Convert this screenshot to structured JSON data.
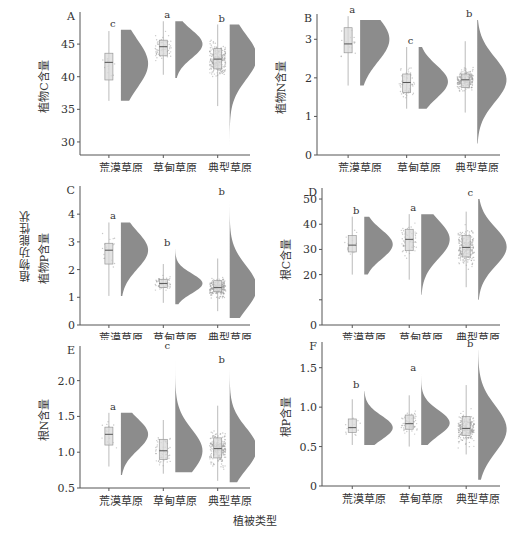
{
  "figure": {
    "group_ylabel": "植物功能性状",
    "xlabel": "植被类型",
    "caption": "图  不同植被类型植物与根系碳氮磷含量"
  },
  "style": {
    "density_color": "#8c8c8c",
    "box_fill": "#d9d9d9",
    "point_color": "#9a9a9a",
    "axis_color": "#555555"
  },
  "chart_data": [
    {
      "id": "A",
      "type": "raincloud",
      "panel_label": "A",
      "ylabel": "植物C含量",
      "categories": [
        "荒漠草原",
        "草甸草原",
        "典型草原"
      ],
      "ylim": [
        28,
        49
      ],
      "yticks": [
        30,
        35,
        40,
        45
      ],
      "letters": [
        "c",
        "a",
        "b"
      ],
      "box": [
        {
          "min": 36.3,
          "q1": 39.5,
          "median": 42.2,
          "q3": 43.6,
          "max": 47.0
        },
        {
          "min": 40.3,
          "q1": 43.2,
          "median": 44.6,
          "q3": 45.6,
          "max": 48.5
        },
        {
          "min": 35.5,
          "q1": 41.2,
          "median": 42.7,
          "q3": 44.3,
          "max": 48.0
        }
      ],
      "density_range": [
        [
          36.3,
          47.2
        ],
        [
          39.8,
          48.5
        ],
        [
          29.0,
          48.0
        ]
      ],
      "density_peak": [
        42.0,
        45.0,
        43.0
      ],
      "n_points": [
        15,
        60,
        300
      ],
      "grid": false
    },
    {
      "id": "B",
      "type": "raincloud",
      "panel_label": "B",
      "ylabel": "植物N含量",
      "categories": [
        "荒漠草原",
        "草甸草原",
        "典型草原"
      ],
      "ylim": [
        0,
        3.5
      ],
      "yticks": [
        0,
        1,
        2,
        3
      ],
      "letters": [
        "a",
        "c",
        "b"
      ],
      "box": [
        {
          "min": 1.8,
          "q1": 2.65,
          "median": 2.88,
          "q3": 3.3,
          "max": 3.6
        },
        {
          "min": 1.2,
          "q1": 1.62,
          "median": 1.88,
          "q3": 2.1,
          "max": 2.8
        },
        {
          "min": 1.1,
          "q1": 1.75,
          "median": 1.95,
          "q3": 2.1,
          "max": 2.95
        }
      ],
      "density_range": [
        [
          1.8,
          3.5
        ],
        [
          1.2,
          2.8
        ],
        [
          0.3,
          3.5
        ]
      ],
      "density_peak": [
        3.0,
        1.9,
        1.95
      ],
      "n_points": [
        15,
        60,
        300
      ],
      "grid": false
    },
    {
      "id": "C",
      "type": "raincloud",
      "panel_label": "C",
      "ylabel": "植物P含量",
      "categories": [
        "荒漠草原",
        "草甸草原",
        "典型草原"
      ],
      "ylim": [
        0,
        4.8
      ],
      "yticks": [
        0,
        1,
        2,
        3,
        4
      ],
      "letters": [
        "a",
        "b",
        "b"
      ],
      "box": [
        {
          "min": 1.05,
          "q1": 2.2,
          "median": 2.7,
          "q3": 2.95,
          "max": 3.7
        },
        {
          "min": 0.8,
          "q1": 1.35,
          "median": 1.5,
          "q3": 1.65,
          "max": 2.2
        },
        {
          "min": 0.5,
          "q1": 1.2,
          "median": 1.35,
          "q3": 1.6,
          "max": 2.4
        }
      ],
      "density_range": [
        [
          1.05,
          3.7
        ],
        [
          0.75,
          2.75
        ],
        [
          0.25,
          4.6
        ]
      ],
      "density_peak": [
        2.7,
        1.5,
        1.35
      ],
      "n_points": [
        15,
        60,
        300
      ],
      "grid": false
    },
    {
      "id": "D",
      "type": "raincloud",
      "panel_label": "D",
      "ylabel": "根C含量",
      "categories": [
        "荒漠草原",
        "草甸草原",
        "典型草原"
      ],
      "ylim": [
        0,
        52
      ],
      "yticks": [
        0,
        10,
        20,
        30,
        40,
        50
      ],
      "ytick_labels": [
        "0",
        "",
        "20",
        "30",
        "40",
        "50"
      ],
      "letters": [
        "b",
        "a",
        "c"
      ],
      "box": [
        {
          "min": 20,
          "q1": 29,
          "median": 31.7,
          "q3": 35.5,
          "max": 43
        },
        {
          "min": 18,
          "q1": 29.5,
          "median": 34,
          "q3": 38,
          "max": 44
        },
        {
          "min": 15,
          "q1": 27,
          "median": 30.8,
          "q3": 35.5,
          "max": 45
        }
      ],
      "density_range": [
        [
          20,
          43
        ],
        [
          12,
          44
        ],
        [
          10,
          50
        ]
      ],
      "density_peak": [
        32,
        34,
        31
      ],
      "n_points": [
        15,
        60,
        300
      ],
      "grid": false
    },
    {
      "id": "E",
      "type": "raincloud",
      "panel_label": "E",
      "ylabel": "根N含量",
      "categories": [
        "荒漠草原",
        "草甸草原",
        "典型草原"
      ],
      "ylim": [
        0.5,
        2.4
      ],
      "yticks": [
        0.5,
        1.0,
        1.5,
        2.0
      ],
      "ytick_labels": [
        "0.5",
        "1.0",
        "1.5",
        "2.0"
      ],
      "letters": [
        "a",
        "c",
        "b"
      ],
      "box": [
        {
          "min": 0.8,
          "q1": 1.1,
          "median": 1.25,
          "q3": 1.35,
          "max": 1.55
        },
        {
          "min": 0.7,
          "q1": 0.9,
          "median": 1.02,
          "q3": 1.18,
          "max": 1.45
        },
        {
          "min": 0.6,
          "q1": 0.92,
          "median": 1.05,
          "q3": 1.2,
          "max": 1.65
        }
      ],
      "density_range": [
        [
          0.68,
          1.55
        ],
        [
          0.72,
          2.4
        ],
        [
          0.58,
          2.2
        ]
      ],
      "density_peak": [
        1.25,
        1.02,
        1.05
      ],
      "n_points": [
        15,
        60,
        300
      ],
      "grid": false
    },
    {
      "id": "F",
      "type": "raincloud",
      "panel_label": "F",
      "ylabel": "根P含量",
      "categories": [
        "荒漠草原",
        "草甸草原",
        "典型草原"
      ],
      "ylim": [
        0,
        1.75
      ],
      "yticks": [
        0,
        0.5,
        1.0,
        1.5
      ],
      "ytick_labels": [
        "0",
        "0.5",
        "1.0",
        "1.5"
      ],
      "letters": [
        "b",
        "a",
        "b"
      ],
      "box": [
        {
          "min": 0.52,
          "q1": 0.68,
          "median": 0.74,
          "q3": 0.85,
          "max": 1.1
        },
        {
          "min": 0.5,
          "q1": 0.72,
          "median": 0.79,
          "q3": 0.9,
          "max": 1.15
        },
        {
          "min": 0.4,
          "q1": 0.64,
          "median": 0.73,
          "q3": 0.88,
          "max": 1.28
        }
      ],
      "density_range": [
        [
          0.52,
          1.2
        ],
        [
          0.52,
          1.42
        ],
        [
          0.08,
          1.72
        ]
      ],
      "density_peak": [
        0.74,
        0.8,
        0.72
      ],
      "n_points": [
        15,
        60,
        300
      ],
      "grid": false
    }
  ]
}
